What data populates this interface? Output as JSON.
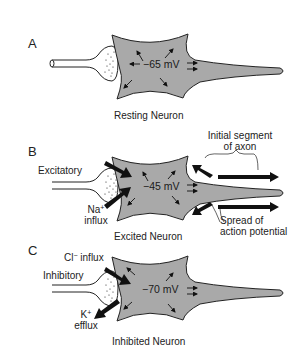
{
  "figure": {
    "colors": {
      "neuron_fill": "#a9a9a9",
      "outline": "#222222",
      "background": "#ffffff",
      "arrow": "#111111"
    },
    "panels": [
      {
        "letter": "A",
        "potential": "−65 mV",
        "caption": "Resting Neuron"
      },
      {
        "letter": "B",
        "potential": "−45 mV",
        "caption": "Excited Neuron",
        "input_label": "Excitatory",
        "ion_label_base": "Na",
        "ion_label_sup": "+",
        "ion_label_line2": "influx",
        "annotation_axon_line1": "Initial segment",
        "annotation_axon_line2": "of axon",
        "annotation_spread_line1": "Spread of",
        "annotation_spread_line2": "action potential"
      },
      {
        "letter": "C",
        "potential": "−70 mV",
        "caption": "Inhibited Neuron",
        "input_label": "Inhibitory",
        "ion1_base": "Cl",
        "ion1_sup": "−",
        "ion1_suffix": " influx",
        "ion2_base": "K",
        "ion2_sup": "+",
        "ion2_line2": "efflux"
      }
    ]
  }
}
